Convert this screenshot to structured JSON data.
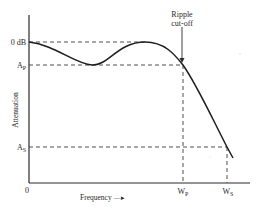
{
  "diagram": {
    "y_axis": {
      "label": "Attenuation",
      "ticks": [
        {
          "id": "zero_db",
          "label": "0 dB"
        },
        {
          "id": "ap",
          "label": "A",
          "sub": "P"
        },
        {
          "id": "as",
          "label": "A",
          "sub": "S"
        }
      ]
    },
    "x_axis": {
      "label": "Frequency",
      "arrow": "—►",
      "origin_label": "0",
      "ticks": [
        {
          "id": "wp",
          "label": "W",
          "sub": "P"
        },
        {
          "id": "ws",
          "label": "W",
          "sub": "S"
        }
      ]
    },
    "annotation": {
      "line1": "Ripple",
      "line2": "cut-off"
    },
    "colors": {
      "ink": "#2a2a2a",
      "background": "#ffffff"
    }
  }
}
